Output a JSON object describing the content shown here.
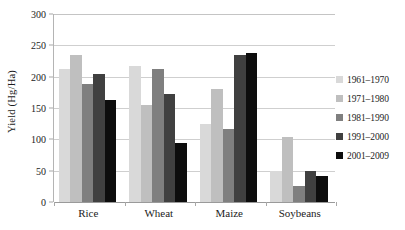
{
  "chart_data": {
    "type": "bar",
    "title": "",
    "xlabel": "",
    "ylabel": "Yield (Hg/Ha)",
    "categories": [
      "Rice",
      "Wheat",
      "Maize",
      "Soybeans"
    ],
    "series": [
      {
        "name": "1961–1970",
        "color": "#d9d9d9",
        "values": [
          213,
          217,
          124,
          50
        ]
      },
      {
        "name": "1971–1980",
        "color": "#bfbfbf",
        "values": [
          234,
          155,
          180,
          104
        ]
      },
      {
        "name": "1981–1990",
        "color": "#7f7f7f",
        "values": [
          189,
          212,
          117,
          25
        ]
      },
      {
        "name": "1991–2000",
        "color": "#404040",
        "values": [
          205,
          172,
          235,
          49
        ]
      },
      {
        "name": "2001–2009",
        "color": "#0d0d0d",
        "values": [
          162,
          94,
          238,
          42
        ]
      }
    ],
    "ylim": [
      0,
      300
    ],
    "yticks": [
      0,
      50,
      100,
      150,
      200,
      250,
      300
    ],
    "ytick_labels": [
      "0",
      "50",
      "100",
      "150",
      "200",
      "250",
      "300"
    ],
    "grid": true,
    "legend_position": "right"
  },
  "legend": {
    "items": [
      {
        "label": "1961–1970",
        "color": "#d9d9d9"
      },
      {
        "label": "1971–1980",
        "color": "#bfbfbf"
      },
      {
        "label": "1981–1990",
        "color": "#7f7f7f"
      },
      {
        "label": "1991–2000",
        "color": "#404040"
      },
      {
        "label": "2001–2009",
        "color": "#0d0d0d"
      }
    ]
  }
}
